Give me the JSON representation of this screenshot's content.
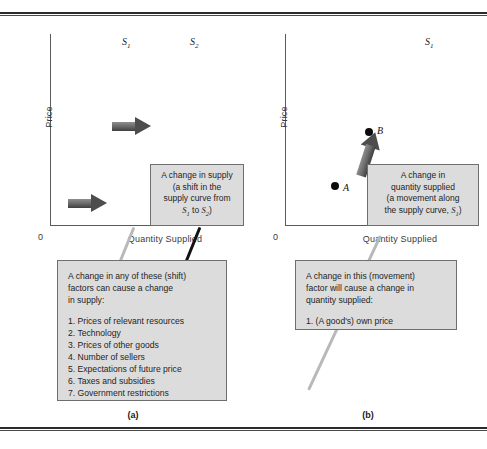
{
  "figure": {
    "panels": [
      {
        "caption": "(a)",
        "axes": {
          "y_label": "Price",
          "x_label": "Quantity Supplied",
          "origin": "0"
        },
        "curves": [
          {
            "label": "S",
            "subscript": "1",
            "style": "light-gray"
          },
          {
            "label": "S",
            "subscript": "2",
            "style": "black"
          }
        ],
        "arrows": [
          {
            "name": "shift-arrow-upper",
            "direction": "right"
          },
          {
            "name": "shift-arrow-lower",
            "direction": "right"
          }
        ],
        "callout": {
          "line1": "A change in supply",
          "line2": "(a shift in the",
          "line3": "supply curve from",
          "line4_prefix": "",
          "line4_s1": "S",
          "line4_s1_sub": "1",
          "line4_mid": " to ",
          "line4_s2": "S",
          "line4_s2_sub": "2",
          "line4_suffix": ")"
        },
        "listbox": {
          "intro_line1": "A change in any of these (shift)",
          "intro_line2": "factors can cause a change",
          "intro_line3": "in supply:",
          "items": [
            "1. Prices of relevant resources",
            "2. Technology",
            "3. Prices of other goods",
            "4. Number of sellers",
            "5. Expectations of future price",
            "6. Taxes and subsidies",
            "7. Government restrictions"
          ]
        }
      },
      {
        "caption": "(b)",
        "axes": {
          "y_label": "Price",
          "x_label": "Quantity Supplied",
          "origin": "0"
        },
        "curves": [
          {
            "label": "S",
            "subscript": "1",
            "style": "light-gray"
          }
        ],
        "points": [
          {
            "label": "A",
            "position": "lower"
          },
          {
            "label": "B",
            "position": "upper"
          }
        ],
        "arrows": [
          {
            "name": "movement-arrow",
            "direction": "up-along-curve"
          }
        ],
        "callout": {
          "line1": "A change in",
          "line2": "quantity supplied",
          "line3": "(a movement along",
          "line4_prefix": "the supply curve, ",
          "line4_s1": "S",
          "line4_s1_sub": "1",
          "line4_suffix": ")"
        },
        "listbox": {
          "intro_line1": "A change in this (movement)",
          "intro_line2": "factor will cause a change in",
          "intro_line3": "quantity supplied:",
          "items": [
            "1. (A good's) own price"
          ]
        }
      }
    ],
    "colors": {
      "curve_light": "#b9b9b9",
      "curve_dark": "#121212",
      "box_fill": "#dcdcdc",
      "box_border": "#6f6f6f",
      "arrow": "#4d4d4d",
      "rule": "#2b2b2b"
    }
  }
}
